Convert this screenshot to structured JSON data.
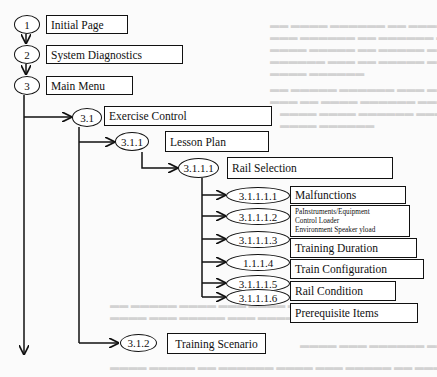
{
  "diagram": {
    "type": "hierarchy-flowchart",
    "nodes": [
      {
        "id": "1",
        "label": "Initial Page"
      },
      {
        "id": "2",
        "label": "System Diagnostics"
      },
      {
        "id": "3",
        "label": "Main Menu"
      },
      {
        "id": "3.1",
        "label": "Exercise Control"
      },
      {
        "id": "3.1.1",
        "label": "Lesson Plan"
      },
      {
        "id": "3.1.1.1",
        "label": "Rail Selection"
      },
      {
        "id": "3.1.1.1.1",
        "label": "Malfunctions"
      },
      {
        "id": "3.1.1.1.2",
        "lines": [
          "PaInstruments/Equipment",
          "Control Loader",
          "Environment Speaker yload"
        ]
      },
      {
        "id": "3.1.1.1.3",
        "label": "Training Duration"
      },
      {
        "id": "3.1.1.1.4",
        "label": "Train Configuration"
      },
      {
        "id": "3.1.1.1.5",
        "label": "Rail Condition"
      },
      {
        "id": "3.1.1.1.6",
        "label": "Prerequisite Items"
      },
      {
        "id": "3.1.2",
        "label": "Training Scenario"
      }
    ],
    "oval_labels": {
      "n1": "1",
      "n2": "2",
      "n3": "3",
      "n31": "3.1",
      "n311": "3.1.1",
      "n3111": "3.1.1.1",
      "n31111": "3.1.1.1.1",
      "n31112": "3.1.1.1.2",
      "n31113": "3.1.1.1.3",
      "n31114": "1.1.1.4",
      "n31115": "3.1.1.1.5",
      "n31116": "3.1.1.1.6",
      "n312": "3.1.2"
    }
  }
}
